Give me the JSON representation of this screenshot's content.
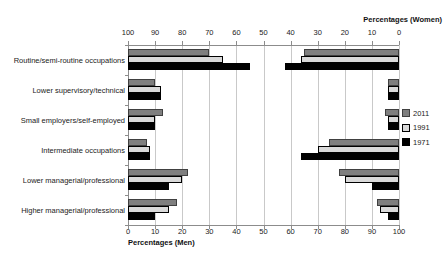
{
  "chart_data": {
    "type": "bar",
    "variant": "horizontal-back-to-back",
    "grid": true,
    "legend_position": "right",
    "categories": [
      "Routine/semi-routine occupations",
      "Lower supervisory/technical",
      "Small employers/self-employed",
      "Intermediate occupations",
      "Lower managerial/professional",
      "Higher managerial/professional"
    ],
    "series": [
      {
        "name": "2011",
        "fill": "#7f7f7f",
        "border": "#404040",
        "men": [
          30,
          10,
          13,
          7,
          22,
          18
        ],
        "women": [
          35,
          4,
          5,
          26,
          22,
          8
        ]
      },
      {
        "name": "1991",
        "fill": "#d9d9d9",
        "border": "#000000",
        "men": [
          35,
          12,
          10,
          8,
          20,
          15
        ],
        "women": [
          36,
          4,
          4,
          30,
          20,
          7
        ]
      },
      {
        "name": "1971",
        "fill": "#000000",
        "border": "#000000",
        "men": [
          45,
          12,
          10,
          8,
          15,
          10
        ],
        "women": [
          42,
          4,
          4,
          36,
          10,
          4
        ]
      }
    ],
    "men_axis": {
      "label": "Percentages (Men)",
      "min": 0,
      "max": 100,
      "step": 10,
      "position": "bottom",
      "ticks": [
        "0",
        "10",
        "20",
        "30",
        "40",
        "50",
        "60",
        "70",
        "80",
        "90",
        "100"
      ]
    },
    "women_axis": {
      "label": "Percentages (Women)",
      "min": 0,
      "max": 100,
      "step": 10,
      "position": "top",
      "reversed": true,
      "ticks": [
        "100",
        "90",
        "80",
        "70",
        "60",
        "50",
        "40",
        "30",
        "20",
        "10",
        "0"
      ]
    }
  },
  "colors": {
    "gridline": "#c9c9c9",
    "axis_line": "#8c8c8c",
    "text": "#222222",
    "background": "#ffffff"
  }
}
